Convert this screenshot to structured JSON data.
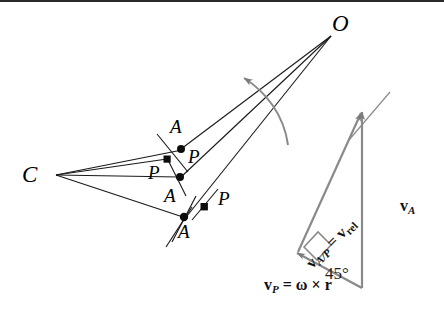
{
  "figure": {
    "background_color": "#ffffff",
    "ink_color": "#000000",
    "vector_color": "#7a7a7a",
    "width": 444,
    "height": 323
  },
  "labels": {
    "center_O": "O",
    "center_C": "C",
    "point_A1": "A",
    "point_A2": "A",
    "point_A3": "A",
    "point_P1": "P",
    "point_P2": "P",
    "point_P3": "P"
  },
  "vectors": {
    "rel": {
      "name": "v_A/P = v_rel",
      "bold_v1": "v",
      "sub1": "A/P",
      "equals": "=",
      "bold_v2": "v",
      "sub2": "rel"
    },
    "absolute_A": {
      "name": "v_A",
      "bold_v": "v",
      "sub": "A"
    },
    "transport_P": {
      "name": "v_P = ω × r",
      "bold_v": "v",
      "sub": "P",
      "equals": "=",
      "omega": "ω",
      "cross": "×",
      "r": "r"
    },
    "angle": "45°"
  },
  "annotations": {
    "rotation_arrow": "curved-rotation-arrow",
    "right_angle_marker": "right-angle-square"
  }
}
